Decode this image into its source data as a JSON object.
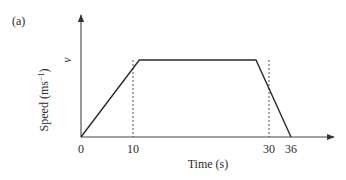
{
  "figure": {
    "panel_label": "(a)"
  },
  "chart_data": {
    "type": "line",
    "title": "",
    "panel_label": "(a)",
    "xlabel": "Time (s)",
    "ylabel": "Speed (ms⁻¹)",
    "ylabel_text": "Speed (ms",
    "ylabel_sup": "−1",
    "ylabel_close": ")",
    "y_tick_label": "v",
    "x_ticks": [
      "0",
      "10",
      "30",
      "36"
    ],
    "x_tick_values": [
      0,
      10,
      30,
      36
    ],
    "series": [
      {
        "name": "speed",
        "x": [
          0,
          10,
          30,
          36
        ],
        "y": [
          "0",
          "v",
          "v",
          "0"
        ],
        "y_normalized": [
          0,
          1,
          1,
          0
        ]
      }
    ],
    "reference_lines": [
      {
        "type": "vertical",
        "x": 10,
        "style": "dashed"
      },
      {
        "type": "vertical",
        "x": 30,
        "style": "dashed"
      }
    ],
    "xlim": [
      0,
      36
    ],
    "grid": false,
    "legend": null
  }
}
